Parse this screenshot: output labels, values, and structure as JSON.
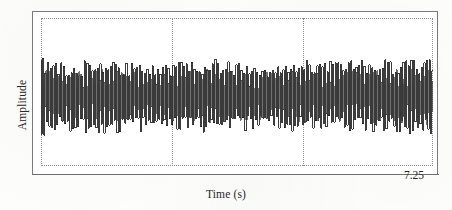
{
  "figure": {
    "title": "",
    "background_color": "#fdfdfc",
    "frame_color": "#7a7a7a",
    "grid_color": "#8c8c8c",
    "trace_color": "#1a1a1a"
  },
  "axes": {
    "ylabel": "Amplitude",
    "xlabel": "Time (s)",
    "x_tick_labels": [
      "7.25"
    ],
    "y_tick_labels": []
  },
  "chart_data": {
    "type": "line",
    "title": "",
    "xlabel": "Time (s)",
    "ylabel": "Amplitude",
    "xlim": [
      0,
      7.25
    ],
    "ylim": [
      -1,
      1
    ],
    "grid": true,
    "legend": "none",
    "x_ticks": [
      7.25
    ],
    "x_tick_labels": [
      "7.25"
    ],
    "y_ticks": [],
    "y_tick_labels": [],
    "gridlines_vertical_fraction": [
      0.0,
      0.335,
      0.67,
      1.0
    ],
    "series": [
      {
        "name": "signal",
        "color": "#1a1a1a",
        "sample_rate_hint": "dense, ~150 visible oscillation bursts over 7.25 s",
        "envelope_x": [
          0.0,
          0.25,
          0.5,
          0.9,
          1.3,
          1.8,
          2.3,
          2.8,
          3.2,
          3.6,
          4.0,
          4.4,
          4.9,
          5.3,
          5.7,
          6.1,
          6.5,
          6.9,
          7.25
        ],
        "envelope_upper": [
          0.78,
          0.7,
          0.66,
          0.68,
          0.7,
          0.66,
          0.64,
          0.69,
          0.72,
          0.66,
          0.63,
          0.67,
          0.7,
          0.66,
          0.68,
          0.71,
          0.69,
          0.72,
          0.74
        ],
        "envelope_lower": [
          -0.8,
          -0.72,
          -0.68,
          -0.7,
          -0.72,
          -0.67,
          -0.65,
          -0.7,
          -0.73,
          -0.67,
          -0.64,
          -0.68,
          -0.71,
          -0.67,
          -0.69,
          -0.72,
          -0.7,
          -0.73,
          -0.76
        ]
      }
    ]
  }
}
